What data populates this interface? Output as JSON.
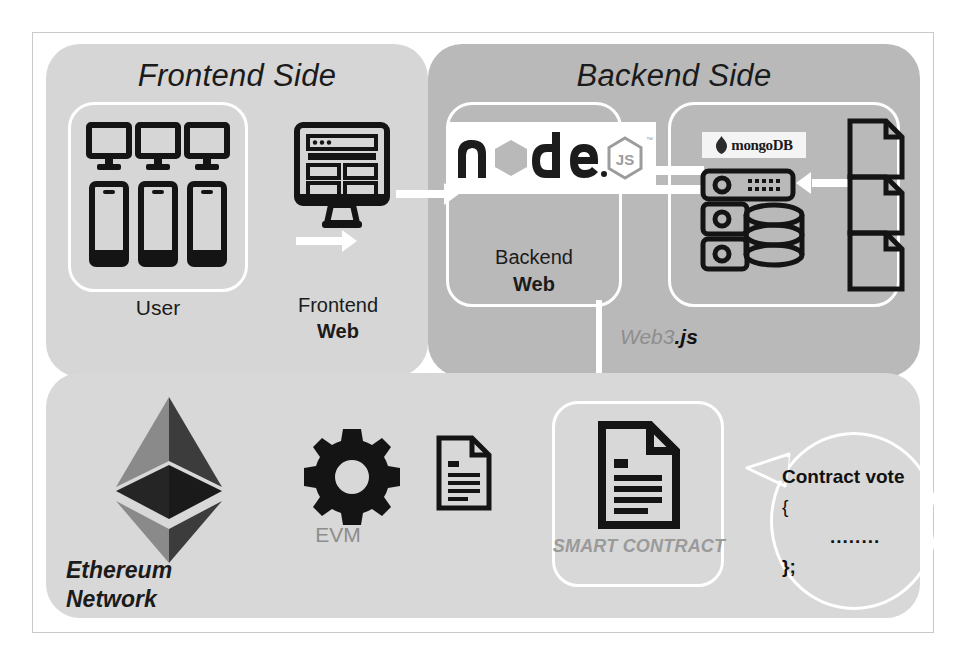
{
  "diagram": {
    "panels": {
      "frontend": {
        "title": "Frontend Side",
        "bg": "#d6d6d6"
      },
      "backend": {
        "title": "Backend Side",
        "bg": "#b9b9b9"
      },
      "blockchain": {
        "title": "",
        "bg": "#d8d8d8"
      }
    },
    "nodes": {
      "user": {
        "label": "User",
        "icon": "devices-icon"
      },
      "frontend_web": {
        "label_top": "Frontend",
        "label_bottom": "Web",
        "icon": "desktop-website-icon"
      },
      "backend_web": {
        "label_top": "Backend",
        "label_bottom": "Web",
        "icon": "nodejs-logo",
        "logo_text": "node"
      },
      "database": {
        "label": "mongoDB",
        "icon": "database-server-icon"
      },
      "documents": {
        "label": "",
        "icon": "document-icon",
        "count": 3
      },
      "evm": {
        "label": "EVM",
        "icon": "gear-icon"
      },
      "ethereum": {
        "label_top": "Ethereum",
        "label_bottom": "Network",
        "icon": "ethereum-logo"
      },
      "smart_contract": {
        "label": "SMART CONTRACT",
        "icon": "contract-document-icon"
      },
      "tx_document": {
        "label": "",
        "icon": "document-lines-icon"
      }
    },
    "connectors": {
      "web3": {
        "label_normal": "Web3",
        "label_bold": ".js"
      }
    },
    "bubble": {
      "line1": "Contract vote",
      "line2": "{",
      "line3": "........",
      "line4": "};"
    },
    "colors": {
      "arrow": "#ffffff",
      "ink": "#111111",
      "muted": "#8e8e8e",
      "panel_dark": "#b9b9b9",
      "panel_light": "#d6d6d6"
    }
  }
}
